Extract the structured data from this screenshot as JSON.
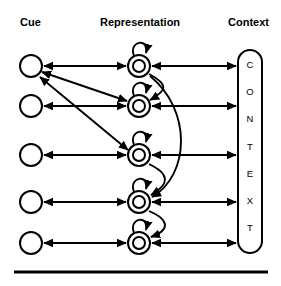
{
  "figure": {
    "background": "#ffffff",
    "ink": "#000000"
  },
  "headers": [
    {
      "label": "Cue",
      "x": 20,
      "y": 26
    },
    {
      "label": "Representation",
      "x": 100,
      "y": 26
    },
    {
      "label": "Context",
      "x": 228,
      "y": 26
    }
  ],
  "columns": {
    "cue_x": 31,
    "representation_x": 139,
    "context_x": 250
  },
  "rows_y": [
    66,
    106,
    155,
    202,
    243
  ],
  "cue_nodes": [
    {
      "name": "cue-1",
      "cx": 31,
      "cy": 66,
      "r": 11
    },
    {
      "name": "cue-2",
      "cx": 31,
      "cy": 106,
      "r": 11
    },
    {
      "name": "cue-3",
      "cx": 31,
      "cy": 155,
      "r": 11
    },
    {
      "name": "cue-4",
      "cx": 31,
      "cy": 202,
      "r": 11
    },
    {
      "name": "cue-5",
      "cx": 31,
      "cy": 243,
      "r": 11
    }
  ],
  "representation_nodes": [
    {
      "name": "representation-1",
      "cx": 139,
      "cy": 66,
      "r_outer": 11,
      "r_inner": 6
    },
    {
      "name": "representation-2",
      "cx": 139,
      "cy": 106,
      "r_outer": 11,
      "r_inner": 6
    },
    {
      "name": "representation-3",
      "cx": 139,
      "cy": 155,
      "r_outer": 11,
      "r_inner": 6
    },
    {
      "name": "representation-4",
      "cx": 139,
      "cy": 202,
      "r_outer": 11,
      "r_inner": 6
    },
    {
      "name": "representation-5",
      "cx": 139,
      "cy": 243,
      "r_outer": 11,
      "r_inner": 6
    }
  ],
  "context_box": {
    "label": "CONTEXT",
    "letters": [
      "C",
      "O",
      "N",
      "T",
      "E",
      "X",
      "T"
    ],
    "letters_y": [
      68,
      95,
      122,
      150,
      177,
      204,
      231
    ],
    "x": 238,
    "y": 50,
    "width": 24,
    "height": 203,
    "radius": 12
  },
  "horizontal_links": [
    {
      "name": "link-cue-1-rep-1",
      "from_row": 0,
      "bidirectional": true
    },
    {
      "name": "link-cue-2-rep-2",
      "from_row": 1,
      "bidirectional": true
    },
    {
      "name": "link-cue-3-rep-3",
      "from_row": 2,
      "bidirectional": true
    },
    {
      "name": "link-cue-4-rep-4",
      "from_row": 3,
      "bidirectional": true
    },
    {
      "name": "link-cue-5-rep-5",
      "from_row": 4,
      "bidirectional": true
    }
  ],
  "context_links": [
    {
      "name": "link-rep-1-context",
      "from_row": 0,
      "bidirectional": true
    },
    {
      "name": "link-rep-2-context",
      "from_row": 1,
      "bidirectional": true
    },
    {
      "name": "link-rep-3-context",
      "from_row": 2,
      "bidirectional": true
    },
    {
      "name": "link-rep-4-context",
      "from_row": 3,
      "bidirectional": true
    },
    {
      "name": "link-rep-5-context",
      "from_row": 4,
      "bidirectional": true
    }
  ],
  "diagonal_links": [
    {
      "name": "link-cue-1-rep-2",
      "from_row": 0,
      "to_row": 1,
      "bidirectional": true
    },
    {
      "name": "link-cue-1-rep-3",
      "from_row": 0,
      "to_row": 2,
      "bidirectional": true
    }
  ],
  "self_loops": [
    {
      "name": "self-loop-rep-1",
      "cy": 66
    },
    {
      "name": "self-loop-rep-2",
      "cy": 106
    },
    {
      "name": "self-loop-rep-3",
      "cy": 155
    },
    {
      "name": "self-loop-rep-4",
      "cy": 202
    },
    {
      "name": "self-loop-rep-5",
      "cy": 243
    }
  ],
  "lateral_arcs": [
    {
      "name": "arc-rep-1-rep-2",
      "from_row": 0,
      "to_row": 1,
      "bulge": 18
    },
    {
      "name": "arc-rep-1-rep-4",
      "from_row": 0,
      "to_row": 3,
      "bulge": 46
    },
    {
      "name": "arc-rep-3-rep-4",
      "from_row": 2,
      "to_row": 3,
      "bulge": 18
    },
    {
      "name": "arc-rep-4-rep-5",
      "from_row": 3,
      "to_row": 4,
      "bulge": 18
    }
  ],
  "baseline_rule": {
    "name": "baseline-rule",
    "x1": 14,
    "x2": 268,
    "y": 272,
    "thickness": 3
  }
}
